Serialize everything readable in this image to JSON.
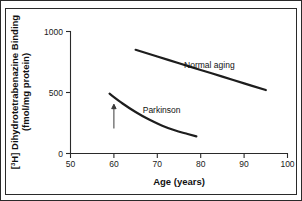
{
  "chart_data": {
    "type": "line",
    "title": "",
    "xlabel": "Age (years)",
    "ylabel": "[3H] Dihydrotetrabenazine Binding (fmol/mg protein)",
    "ylabel_line1_prefix": "[",
    "ylabel_line1_sup": "3",
    "ylabel_line1_rest": "H] Dihydrotetrabenazine Binding",
    "ylabel_line2": "(fmol/mg protein)",
    "xlim": [
      50,
      100
    ],
    "ylim": [
      0,
      1000
    ],
    "xticks": [
      50,
      60,
      70,
      80,
      90,
      100
    ],
    "xtick_labels": [
      "50",
      "60",
      "70",
      "80",
      "90",
      "100"
    ],
    "yticks": [
      0,
      500,
      1000
    ],
    "ytick_labels": [
      "0",
      "500",
      "1000"
    ],
    "grid": false,
    "legend": "inline-labels",
    "series": [
      {
        "name": "Normal aging",
        "label": "Normal aging",
        "label_x": 82,
        "label_y": 700,
        "x": [
          65,
          70,
          75,
          80,
          85,
          90,
          95
        ],
        "values": [
          850,
          795,
          740,
          685,
          630,
          575,
          520
        ]
      },
      {
        "name": "Parkinson",
        "label": "Parkinson",
        "label_x": 71,
        "label_y": 330,
        "x": [
          59,
          62,
          65,
          68,
          71,
          74,
          77,
          79
        ],
        "values": [
          490,
          410,
          340,
          280,
          230,
          190,
          160,
          140
        ]
      }
    ],
    "annotations": [
      {
        "type": "arrow",
        "name": "onset-arrow",
        "x": 60,
        "y_tail": 205,
        "y_head": 400,
        "direction": "up",
        "text": ""
      }
    ]
  }
}
